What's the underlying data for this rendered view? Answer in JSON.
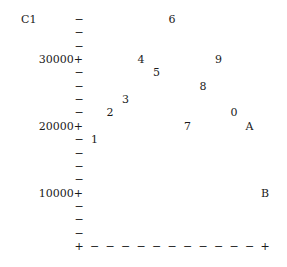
{
  "chart_data": {
    "type": "scatter",
    "title": "",
    "xlabel": "",
    "ylabel": "C1",
    "ylim": [
      2000,
      36000
    ],
    "y_ticks": [
      {
        "value": 30000,
        "label": "30000+"
      },
      {
        "value": 20000,
        "label": "20000+"
      },
      {
        "value": 10000,
        "label": "10000+"
      }
    ],
    "y_step_per_row": 2000,
    "x_columns": 12,
    "x_tick_labels": [],
    "grid": false,
    "legend": null,
    "points": [
      {
        "label": "1",
        "x": 1,
        "y": 18000
      },
      {
        "label": "2",
        "x": 2,
        "y": 22000
      },
      {
        "label": "3",
        "x": 3,
        "y": 24000
      },
      {
        "label": "4",
        "x": 4,
        "y": 30000
      },
      {
        "label": "5",
        "x": 5,
        "y": 28000
      },
      {
        "label": "6",
        "x": 6,
        "y": 36000
      },
      {
        "label": "7",
        "x": 7,
        "y": 20000
      },
      {
        "label": "8",
        "x": 8,
        "y": 26000
      },
      {
        "label": "9",
        "x": 9,
        "y": 30000
      },
      {
        "label": "0",
        "x": 10,
        "y": 22000
      },
      {
        "label": "A",
        "x": 11,
        "y": 20000
      },
      {
        "label": "B",
        "x": 12,
        "y": 10000
      }
    ]
  },
  "axis": {
    "y_minor_mark": "−",
    "y_major_mark": "+",
    "x_minor_mark": "−",
    "corner_mark": "+"
  }
}
